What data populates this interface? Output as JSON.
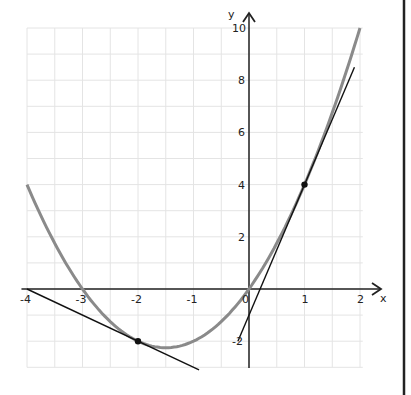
{
  "chart_data": {
    "type": "line",
    "title": "",
    "xlabel": "x",
    "ylabel": "y",
    "xlim": [
      -4,
      2
    ],
    "ylim": [
      -3,
      10
    ],
    "grid": true,
    "x_ticks": [
      "-4",
      "-3",
      "-2",
      "-1",
      "0",
      "1",
      "2"
    ],
    "y_ticks": [
      "10",
      "8",
      "6",
      "4",
      "2",
      "-2"
    ],
    "series": [
      {
        "name": "f(x) = x^2 + 3x",
        "kind": "curve",
        "color": "#8a8a8a",
        "x": [
          -4,
          -3,
          -2,
          -1.5,
          -1,
          0,
          1,
          2
        ],
        "values": [
          4,
          0,
          -2,
          -2.25,
          -2,
          0,
          4,
          10
        ]
      },
      {
        "name": "tangent at x=1: y = 5x - 1",
        "kind": "line",
        "color": "#111111",
        "x": [
          -0.2,
          1.9
        ],
        "values": [
          -2,
          8.5
        ]
      },
      {
        "name": "tangent at x=-2: y = -x - 4",
        "kind": "line",
        "color": "#111111",
        "x": [
          -4,
          -0.9
        ],
        "values": [
          0,
          -3.1
        ]
      }
    ],
    "points": [
      {
        "label": "tangent-point-1",
        "x": 1,
        "y": 4
      },
      {
        "label": "tangent-point-2",
        "x": -2,
        "y": -2
      }
    ]
  },
  "labels": {
    "x_axis": "x",
    "y_axis": "y",
    "origin": "0"
  }
}
